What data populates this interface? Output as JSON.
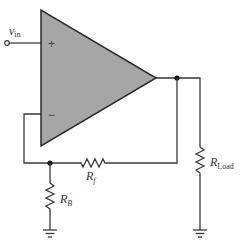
{
  "diagram": {
    "colors": {
      "opamp_fill": "#a6a6a6",
      "opamp_stroke": "#2a2a2a",
      "wire": "#3a3a3a",
      "background": "#ffffff"
    },
    "opamp": {
      "plus_sign": "+",
      "minus_sign": "−"
    },
    "input": {
      "label_main": "v",
      "label_sub": "in"
    },
    "resistors": {
      "rf": {
        "label_main": "R",
        "label_sub": "f"
      },
      "rb": {
        "label_main": "R",
        "label_sub": "B"
      },
      "rload": {
        "label_main": "R",
        "label_sub": "Load"
      }
    },
    "icons": [
      "opamp-triangle-icon",
      "resistor-icon",
      "ground-icon",
      "terminal-icon",
      "junction-dot-icon"
    ]
  }
}
